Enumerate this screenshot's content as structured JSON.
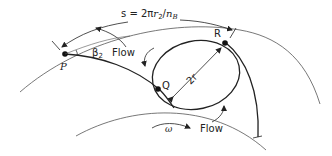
{
  "diagram": {
    "type": "impeller-relative-eddy",
    "labels": {
      "pitch_formula_s": "s = 2",
      "pitch_formula_pi": "π",
      "pitch_formula_r": "r",
      "pitch_formula_sub2": "2",
      "pitch_formula_slash": "/",
      "pitch_formula_n": "n",
      "pitch_formula_subB": "B",
      "point_p": "P",
      "point_q": "Q",
      "point_r": "R",
      "angle_beta": "β",
      "angle_sub": "2",
      "flow_top": "Flow",
      "flow_bottom": "Flow",
      "omega": "ω",
      "diameter_2r": "2r"
    },
    "colors": {
      "line": "#222222",
      "thin_line": "#555555",
      "background": "#ffffff"
    }
  }
}
